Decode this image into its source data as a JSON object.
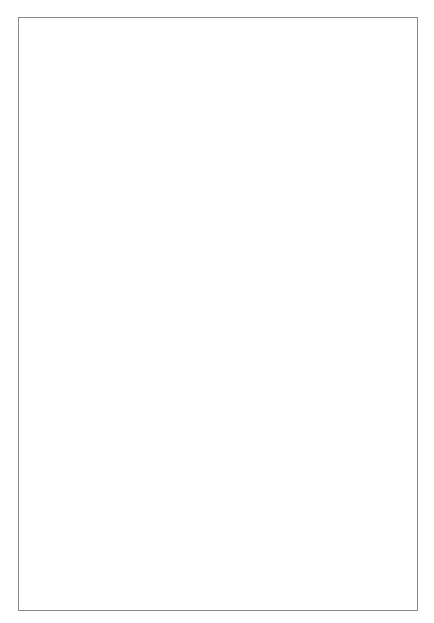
{
  "table": {
    "rows": [
      {
        "clock": "2",
        "cells": [
          null,
          {
            "label": "Dd2",
            "top": {
              "wind": "delta",
              "vec": "delta",
              "arrow": 0
            },
            "bottom": {
              "wind": "delta",
              "vec": "delta",
              "arrow": 60
            }
          },
          {
            "label": "Dz2",
            "top": {
              "wind": "delta",
              "vec": "delta",
              "arrow": 0
            },
            "bottom": {
              "wind": "zigzag",
              "vec": "zigzag",
              "arrow": 60
            }
          }
        ]
      },
      {
        "clock": "4",
        "cells": [
          null,
          {
            "label": "Dd4",
            "top": {
              "wind": "delta",
              "vec": "delta",
              "arrow": 0
            },
            "bottom": {
              "wind": "delta",
              "vec": "delta",
              "arrow": 120
            }
          },
          {
            "label": "Dz4",
            "top": {
              "wind": "delta",
              "vec": "delta",
              "arrow": 0
            },
            "bottom": {
              "wind": "zigzag",
              "vec": "zigzag",
              "arrow": 120
            }
          }
        ]
      },
      {
        "clock": "7",
        "cells": [
          {
            "label": "Yd7",
            "top": {
              "wind": "star",
              "vec": "star",
              "arrow": 0
            },
            "bottom": {
              "wind": "delta",
              "vec": "delta",
              "arrow": 210
            }
          },
          {
            "label": "Dy7",
            "top": {
              "wind": "delta",
              "vec": "delta",
              "arrow": 0
            },
            "bottom": {
              "wind": "star",
              "vec": "star",
              "arrow": 210
            }
          },
          {
            "label": "Yz7",
            "top": {
              "wind": "star",
              "vec": "star",
              "arrow": 0
            },
            "bottom": {
              "wind": "zigzag",
              "vec": "zigzag",
              "arrow": 210
            }
          }
        ]
      },
      {
        "clock": "8",
        "cells": [
          null,
          {
            "label": "Dd8",
            "top": {
              "wind": "delta",
              "vec": "delta",
              "arrow": 0
            },
            "bottom": {
              "wind": "delta",
              "vec": "delta",
              "arrow": 240
            }
          },
          {
            "label": "Dz8",
            "top": {
              "wind": "delta",
              "vec": "delta",
              "arrow": 0
            },
            "bottom": {
              "wind": "zigzag",
              "vec": "zigzag",
              "arrow": 240
            }
          }
        ]
      },
      {
        "clock": "10",
        "cells": [
          null,
          {
            "label": "Dd10",
            "top": {
              "wind": "delta",
              "vec": "delta",
              "arrow": 0
            },
            "bottom": {
              "wind": "delta",
              "vec": "delta",
              "arrow": 300
            }
          },
          {
            "label": "Dz10",
            "top": {
              "wind": "delta",
              "vec": "delta",
              "arrow": 0
            },
            "bottom": {
              "wind": "zigzag",
              "vec": "zigzag",
              "arrow": 300
            }
          }
        ]
      }
    ],
    "row_heights": [
      118,
      121,
      119,
      119,
      117
    ]
  },
  "colors": {
    "line": "#555555",
    "border": "#8a8a8a"
  }
}
